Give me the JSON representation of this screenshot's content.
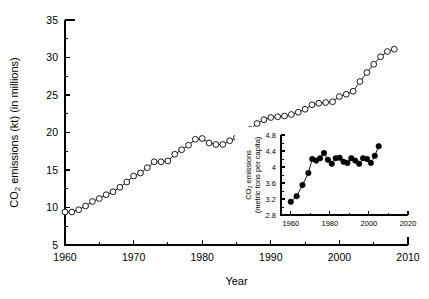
{
  "figure": {
    "background": "#ffffff",
    "foreground": "#000000"
  },
  "main_axes": {
    "xlabel": "Year",
    "ylabel_pre": "CO",
    "ylabel_sub": "2",
    "ylabel_post": " emissions (kt) (in millions)",
    "x_ticklabels": [
      "1960",
      "1970",
      "1980",
      "1990",
      "2000",
      "2010"
    ],
    "y_ticklabels": [
      "5",
      "10",
      "15",
      "20",
      "25",
      "30",
      "35"
    ]
  },
  "inset_axes": {
    "ylabel_pre": "CO",
    "ylabel_sub": "2",
    "ylabel_post": " emissions",
    "ylabel_line2": "(metric tons per capita)",
    "x_ticklabels": [
      "1960",
      "1980",
      "2000",
      "2020"
    ],
    "y_ticklabels": [
      "2.8",
      "3.2",
      "3.6",
      "4",
      "4.4",
      "4.8"
    ]
  },
  "chart_data": [
    {
      "type": "line",
      "id": "main",
      "title": "",
      "xlabel": "Year",
      "ylabel": "CO2 emissions (kt) (in millions)",
      "xlim": [
        1960,
        2010
      ],
      "ylim": [
        5,
        35
      ],
      "xticks": [
        1960,
        1970,
        1980,
        1990,
        2000,
        2010
      ],
      "yticks": [
        5,
        10,
        15,
        20,
        25,
        30,
        35
      ],
      "xminorticks": [
        1965,
        1975,
        1985,
        1995,
        2005
      ],
      "yminorticks": [
        7.5,
        12.5,
        17.5,
        22.5,
        27.5,
        32.5
      ],
      "grid": false,
      "legend": "none",
      "marker": "open-circle",
      "x": [
        1960,
        1961,
        1962,
        1963,
        1964,
        1965,
        1966,
        1967,
        1968,
        1969,
        1970,
        1971,
        1972,
        1973,
        1974,
        1975,
        1976,
        1977,
        1978,
        1979,
        1980,
        1981,
        1982,
        1983,
        1984,
        1985,
        1986,
        1987,
        1988,
        1989,
        1990,
        1991,
        1992,
        1993,
        1994,
        1995,
        1996,
        1997,
        1998,
        1999,
        2000,
        2001,
        2002,
        2003,
        2004,
        2005,
        2006,
        2007,
        2008
      ],
      "y": [
        9.4,
        9.4,
        9.7,
        10.2,
        10.8,
        11.2,
        11.7,
        12.1,
        12.7,
        13.4,
        14.2,
        14.6,
        15.3,
        16.1,
        16.1,
        16.2,
        17.1,
        17.7,
        18.3,
        19.1,
        19.2,
        18.6,
        18.4,
        18.4,
        18.9,
        19.3,
        19.8,
        20.4,
        21.2,
        21.7,
        22.0,
        22.1,
        22.2,
        22.4,
        22.7,
        23.1,
        23.7,
        23.9,
        24.0,
        24.1,
        24.8,
        25.1,
        25.5,
        26.8,
        28.0,
        29.1,
        30.1,
        30.8,
        31.1
      ]
    },
    {
      "type": "line",
      "id": "inset",
      "title": "",
      "xlabel": "",
      "ylabel": "CO2 emissions (metric tons per capita)",
      "xlim": [
        1955,
        2020
      ],
      "ylim": [
        2.8,
        4.8
      ],
      "xticks": [
        1960,
        1980,
        2000,
        2020
      ],
      "yticks": [
        2.8,
        3.2,
        3.6,
        4,
        4.4,
        4.8
      ],
      "xminorticks": [
        1970,
        1990,
        2010
      ],
      "yminorticks": [
        3.0,
        3.4,
        3.8,
        4.2,
        4.6
      ],
      "grid": false,
      "legend": "none",
      "marker": "filled-circle",
      "x": [
        1960,
        1963,
        1966,
        1969,
        1971,
        1973,
        1975,
        1977,
        1979,
        1981,
        1983,
        1985,
        1987,
        1989,
        1991,
        1993,
        1995,
        1997,
        1999,
        2001,
        2003,
        2005
      ],
      "y": [
        3.13,
        3.27,
        3.55,
        3.85,
        4.2,
        4.16,
        4.22,
        4.35,
        4.18,
        4.08,
        4.22,
        4.23,
        4.13,
        4.1,
        4.22,
        4.16,
        4.08,
        4.22,
        4.2,
        4.1,
        4.28,
        4.52
      ]
    }
  ]
}
